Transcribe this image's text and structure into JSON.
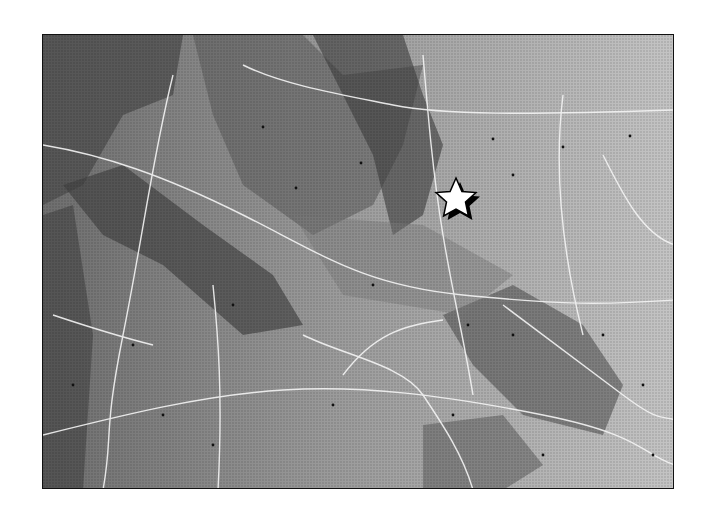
{
  "map": {
    "type": "shaded-relief",
    "colors": {
      "frame": "#111111",
      "background": "#ffffff",
      "roads": "#f2f2f2",
      "terrain_light": "#c8c8c8",
      "terrain_dark": "#3a3a3a"
    },
    "marker": {
      "shape": "star",
      "fill": "#ffffff",
      "outline": "#000000",
      "x": 435,
      "y": 177
    },
    "labels_legible": false
  }
}
